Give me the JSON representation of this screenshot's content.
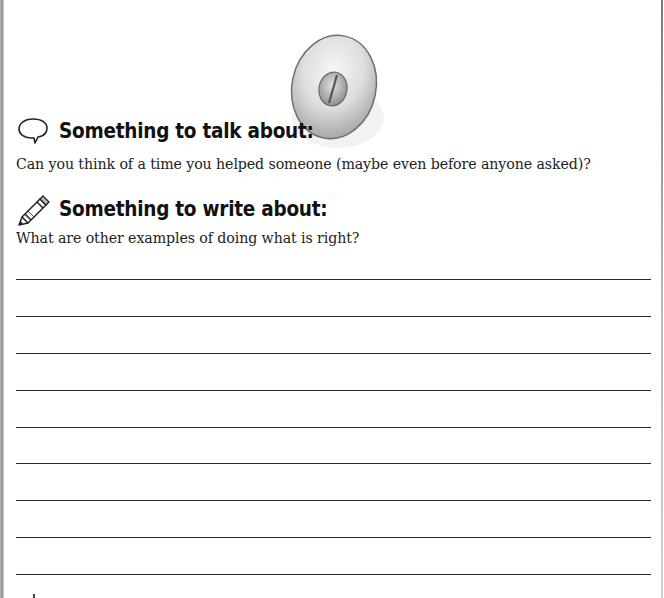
{
  "illustration": {
    "name": "doorknob-illustration",
    "description": "round knob with slotted screw center",
    "colors": {
      "rim": "#9a9a9a",
      "face": "#e6e6e6",
      "shadow": "#bfbfbf",
      "screw": "#a8a8a8"
    }
  },
  "talk_section": {
    "icon": "speech-bubble-icon",
    "heading": "Something to talk about:",
    "prompt": "Can you think of a time you helped someone (maybe even before anyone asked)?"
  },
  "write_section": {
    "icon": "pencil-icon",
    "heading": "Something to write about:",
    "prompt": "What are other examples of doing what is right?",
    "line_count": 9
  }
}
